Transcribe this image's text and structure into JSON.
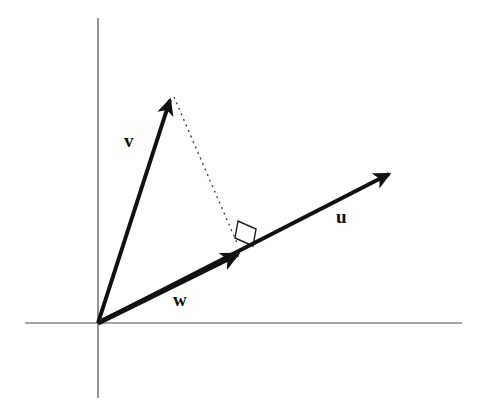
{
  "figure": {
    "width": 484,
    "height": 416,
    "background_color": "#ffffff"
  },
  "axes": {
    "stroke_color": "#4d4d4d",
    "stroke_width": 1.2,
    "origin": {
      "x": 98,
      "y": 323
    },
    "x_axis": {
      "x1": 25,
      "y1": 323,
      "x2": 462,
      "y2": 323
    },
    "y_axis": {
      "x1": 98,
      "y1": 18,
      "x2": 98,
      "y2": 398
    }
  },
  "vectors": [
    {
      "name": "v",
      "label": "v",
      "label_position": {
        "x": 124,
        "y": 131
      },
      "start": {
        "x": 98,
        "y": 323
      },
      "end": {
        "x": 172,
        "y": 94
      },
      "stroke_color": "#111111",
      "stroke_width": 4,
      "arrowhead": true
    },
    {
      "name": "u",
      "label": "u",
      "label_position": {
        "x": 336,
        "y": 207
      },
      "start": {
        "x": 98,
        "y": 323
      },
      "end": {
        "x": 392,
        "y": 172
      },
      "stroke_color": "#111111",
      "stroke_width": 4,
      "arrowhead": true
    },
    {
      "name": "w",
      "label": "w",
      "label_position": {
        "x": 173,
        "y": 290
      },
      "start": {
        "x": 98,
        "y": 323
      },
      "end": {
        "x": 243,
        "y": 252
      },
      "stroke_color": "#111111",
      "stroke_width": 5,
      "arrowhead": true
    }
  ],
  "projection_line": {
    "name": "dashed-projection",
    "start": {
      "x": 174,
      "y": 97
    },
    "end": {
      "x": 237,
      "y": 243
    },
    "stroke_color": "#3a3a3a",
    "stroke_width": 1.3,
    "dash_pattern": "2 4"
  },
  "right_angle_marker": {
    "name": "right-angle-square",
    "points": "235,238 238,221 256,229 253,246",
    "stroke_color": "#1a1a1a",
    "stroke_width": 1.4,
    "fill": "none"
  },
  "colors": {
    "vector_stroke": "#111111",
    "axis_stroke": "#4d4d4d",
    "dashed_stroke": "#3a3a3a",
    "label_text": "#0d0d0d",
    "background": "#ffffff"
  }
}
